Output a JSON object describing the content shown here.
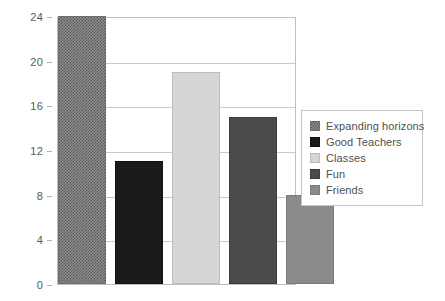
{
  "chart_data": {
    "type": "bar",
    "title": "",
    "subtitle": "",
    "xlabel": "",
    "ylabel": "",
    "categories": [
      "Expanding horizons",
      "Good Teachers",
      "Classes",
      "Fun",
      "Friends"
    ],
    "values": [
      24,
      11,
      19,
      15,
      8
    ],
    "ylim": [
      0,
      24
    ],
    "y_ticks": [
      0,
      4,
      8,
      12,
      16,
      20,
      24
    ],
    "y_tick_labels": [
      "0",
      "4",
      "8",
      "12",
      "16",
      "20",
      "24"
    ],
    "x_tick_labels": [],
    "grid": true,
    "grid_axis": "y",
    "legend_position": "right",
    "series": [
      {
        "name": "Expanding horizons",
        "value": 24,
        "fill_style": "checkerboard-hatch",
        "color": "#8e8e8e"
      },
      {
        "name": "Good Teachers",
        "value": 11,
        "fill_style": "solid",
        "color": "#1b1b1b"
      },
      {
        "name": "Classes",
        "value": 19,
        "fill_style": "solid",
        "color": "#d6d6d6"
      },
      {
        "name": "Fun",
        "value": 15,
        "fill_style": "solid",
        "color": "#4b4b4b"
      },
      {
        "name": "Friends",
        "value": 8,
        "fill_style": "solid",
        "color": "#8b8b8b"
      }
    ]
  },
  "legend": {
    "items": [
      {
        "label": "Expanding horizons",
        "color": "#8e8e8e",
        "fill_style": "checkerboard-hatch"
      },
      {
        "label": "Good Teachers",
        "color": "#1b1b1b",
        "fill_style": "solid"
      },
      {
        "label": "Classes",
        "color": "#d6d6d6",
        "fill_style": "solid"
      },
      {
        "label": "Fun",
        "color": "#4b4b4b",
        "fill_style": "solid"
      },
      {
        "label": "Friends",
        "color": "#8b8b8b",
        "fill_style": "solid"
      }
    ]
  },
  "axes": {
    "y_tick_labels": [
      "24",
      "20",
      "16",
      "12",
      "8",
      "4",
      "0"
    ]
  },
  "style": {
    "plot_background": "#ffffff",
    "frame_color": "#bfbfbf",
    "gridline_color": "#c9c9c9",
    "tick_text_color": "#595959",
    "legend_text_color": "#4f4f4f"
  }
}
